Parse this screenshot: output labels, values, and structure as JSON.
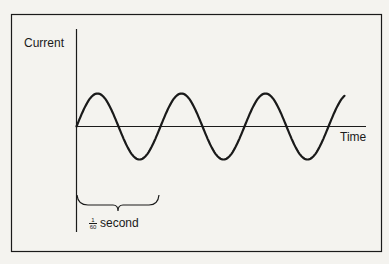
{
  "diagram": {
    "title": "",
    "y_axis_label": "Current",
    "x_axis_label": "Time",
    "period_annotation": {
      "numerator": "1",
      "denominator": "60",
      "unit": "second"
    },
    "wave": {
      "type": "sine",
      "cycles_shown": 3.2,
      "period_px": 84,
      "amplitude_px": 33
    },
    "colors": {
      "background": "#f4f3ef",
      "ink": "#1a1a1a"
    }
  }
}
